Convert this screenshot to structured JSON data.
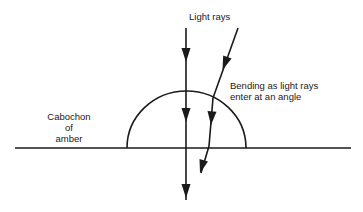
{
  "diagram": {
    "title_label": "Light rays",
    "annotation": {
      "line1": "Bending as light rays",
      "line2": "enter at an angle"
    },
    "object_label": {
      "line1": "Cabochon",
      "line2": "of",
      "line3": "amber"
    },
    "colors": {
      "ink": "#1a1a1a",
      "background": "#ffffff"
    }
  }
}
